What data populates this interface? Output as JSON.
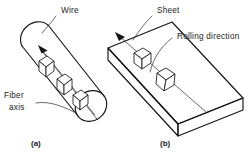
{
  "figure": {
    "type": "technical-line-diagram",
    "background_color": "#ffffff",
    "line_color": "#151515",
    "text_color": "#1a1a1a"
  },
  "panel_a": {
    "caption": "(a)",
    "shape": "cylinder-wire",
    "labels": {
      "wire": "Wire",
      "fiber_axis_line1": "Fiber",
      "fiber_axis_line2": "axis"
    },
    "grain_cubes": 3,
    "arrow_direction": "up-left along wire axis"
  },
  "panel_b": {
    "caption": "(b)",
    "shape": "rectangular-slab-sheet",
    "labels": {
      "sheet": "Sheet",
      "rolling_direction": "Rolling direction"
    },
    "grain_cubes": 2,
    "arrow_direction": "up-left along rolling direction"
  }
}
